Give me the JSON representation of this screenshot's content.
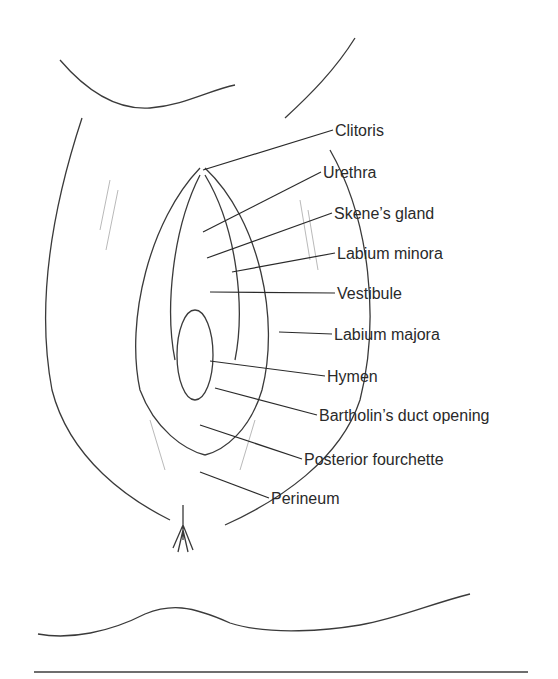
{
  "figure": {
    "type": "anatomical-diagram"
  },
  "labels": [
    {
      "text": "Clitoris",
      "x": 335,
      "y": 122,
      "target": [
        203,
        170
      ]
    },
    {
      "text": "Urethra",
      "x": 323,
      "y": 164,
      "target": [
        203,
        232
      ]
    },
    {
      "text": "Skene’s gland",
      "x": 334,
      "y": 205,
      "target": [
        207,
        258
      ]
    },
    {
      "text": "Labium minora",
      "x": 337,
      "y": 245,
      "target": [
        232,
        272
      ]
    },
    {
      "text": "Vestibule",
      "x": 337,
      "y": 285,
      "target": [
        210,
        292
      ]
    },
    {
      "text": "Labium majora",
      "x": 334,
      "y": 326,
      "target": [
        279,
        332
      ]
    },
    {
      "text": "Hymen",
      "x": 327,
      "y": 368,
      "target": [
        210,
        361
      ]
    },
    {
      "text": "Bartholin’s duct opening",
      "x": 319,
      "y": 407,
      "target": [
        215,
        388
      ]
    },
    {
      "text": "Posterior fourchette",
      "x": 304,
      "y": 451,
      "target": [
        200,
        425
      ]
    },
    {
      "text": "Perineum",
      "x": 271,
      "y": 490,
      "target": [
        200,
        472
      ]
    }
  ],
  "colors": {
    "line": "#2a2a2a",
    "text": "#2a2a2a",
    "rule": "#6e6e6e"
  }
}
